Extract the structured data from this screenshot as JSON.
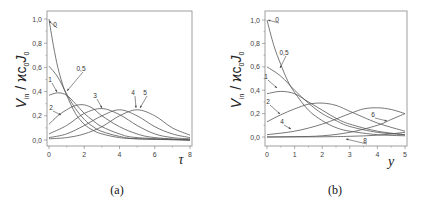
{
  "chart_data": [
    {
      "type": "line",
      "panel": "(a)",
      "title": "",
      "xlabel": "τ",
      "ylabel": "V_in / ϰc0J0",
      "xlim": [
        0,
        8
      ],
      "ylim": [
        0,
        1.0
      ],
      "xticks": [
        "0",
        "2",
        "4",
        "6",
        "8"
      ],
      "yticks": [
        "0,0",
        "0,2",
        "0,4",
        "0,6",
        "0,8",
        "1,0"
      ],
      "grid": false,
      "series": [
        {
          "name": "0",
          "points": [
            [
              0,
              1.0
            ],
            [
              0.25,
              0.78
            ],
            [
              0.5,
              0.6
            ],
            [
              0.75,
              0.47
            ],
            [
              1,
              0.37
            ],
            [
              1.5,
              0.22
            ],
            [
              2,
              0.13
            ],
            [
              2.5,
              0.08
            ],
            [
              3,
              0.05
            ],
            [
              4,
              0.02
            ],
            [
              5,
              0.01
            ],
            [
              8,
              0.0
            ]
          ]
        },
        {
          "name": "0,5",
          "points": [
            [
              0,
              0.61
            ],
            [
              0.5,
              0.52
            ],
            [
              1,
              0.38
            ],
            [
              1.5,
              0.26
            ],
            [
              2,
              0.17
            ],
            [
              2.5,
              0.11
            ],
            [
              3,
              0.07
            ],
            [
              4,
              0.03
            ],
            [
              5,
              0.01
            ],
            [
              8,
              0.0
            ]
          ]
        },
        {
          "name": "1",
          "points": [
            [
              0,
              0.37
            ],
            [
              0.5,
              0.39
            ],
            [
              1,
              0.37
            ],
            [
              1.5,
              0.3
            ],
            [
              2,
              0.22
            ],
            [
              2.5,
              0.16
            ],
            [
              3,
              0.11
            ],
            [
              4,
              0.05
            ],
            [
              5,
              0.02
            ],
            [
              8,
              0.0
            ]
          ]
        },
        {
          "name": "2",
          "points": [
            [
              0,
              0.13
            ],
            [
              0.5,
              0.2
            ],
            [
              1,
              0.25
            ],
            [
              1.5,
              0.285
            ],
            [
              2,
              0.29
            ],
            [
              2.5,
              0.26
            ],
            [
              3,
              0.2
            ],
            [
              4,
              0.11
            ],
            [
              5,
              0.05
            ],
            [
              6,
              0.02
            ],
            [
              8,
              0.0
            ]
          ]
        },
        {
          "name": "3",
          "points": [
            [
              0,
              0.05
            ],
            [
              1,
              0.12
            ],
            [
              2,
              0.22
            ],
            [
              3,
              0.26
            ],
            [
              4,
              0.21
            ],
            [
              5,
              0.12
            ],
            [
              6,
              0.05
            ],
            [
              7,
              0.02
            ],
            [
              8,
              0.01
            ]
          ]
        },
        {
          "name": "4",
          "points": [
            [
              0,
              0.02
            ],
            [
              1,
              0.05
            ],
            [
              2,
              0.12
            ],
            [
              3,
              0.2
            ],
            [
              4,
              0.25
            ],
            [
              5,
              0.2
            ],
            [
              6,
              0.11
            ],
            [
              7,
              0.05
            ],
            [
              8,
              0.02
            ]
          ]
        },
        {
          "name": "5",
          "points": [
            [
              0,
              0.01
            ],
            [
              1,
              0.02
            ],
            [
              2,
              0.05
            ],
            [
              3,
              0.11
            ],
            [
              4,
              0.2
            ],
            [
              5,
              0.25
            ],
            [
              6,
              0.2
            ],
            [
              7,
              0.1
            ],
            [
              8,
              0.04
            ]
          ]
        }
      ],
      "annotations": [
        {
          "text": "0",
          "x": 55,
          "y": 27,
          "ax": 49,
          "ay": 21
        },
        {
          "text": "0,5",
          "x": 81,
          "y": 71,
          "ax": 67,
          "ay": 91
        },
        {
          "text": "1",
          "x": 50,
          "y": 82,
          "ax": 57,
          "ay": 92
        },
        {
          "text": "2",
          "x": 51,
          "y": 110,
          "ax": 61,
          "ay": 115
        },
        {
          "text": "3",
          "x": 95,
          "y": 98,
          "ax": 102,
          "ay": 108
        },
        {
          "text": "4",
          "x": 133,
          "y": 95,
          "ax": 136,
          "ay": 108
        },
        {
          "text": "5",
          "x": 145,
          "y": 95,
          "ax": 140,
          "ay": 108
        }
      ],
      "caption": "(a)"
    },
    {
      "type": "line",
      "panel": "(b)",
      "title": "",
      "xlabel": "y",
      "ylabel": "V_in / ϰc0J0",
      "xlim": [
        0,
        5
      ],
      "ylim": [
        0,
        1.0
      ],
      "xticks": [
        "0",
        "1",
        "2",
        "3",
        "4",
        "5"
      ],
      "yticks": [
        "0,0",
        "0,2",
        "0,4",
        "0,6",
        "0,8",
        "1,0"
      ],
      "grid": false,
      "series": [
        {
          "name": "0",
          "points": [
            [
              0,
              1.0
            ],
            [
              0.25,
              0.78
            ],
            [
              0.5,
              0.62
            ],
            [
              0.75,
              0.48
            ],
            [
              1,
              0.38
            ],
            [
              1.5,
              0.23
            ],
            [
              2,
              0.14
            ],
            [
              2.5,
              0.08
            ],
            [
              3,
              0.05
            ],
            [
              4,
              0.02
            ],
            [
              5,
              0.01
            ]
          ]
        },
        {
          "name": "0,5",
          "points": [
            [
              0,
              0.6
            ],
            [
              0.5,
              0.52
            ],
            [
              1,
              0.4
            ],
            [
              1.5,
              0.29
            ],
            [
              2,
              0.2
            ],
            [
              2.5,
              0.14
            ],
            [
              3,
              0.09
            ],
            [
              4,
              0.04
            ],
            [
              5,
              0.02
            ]
          ]
        },
        {
          "name": "1",
          "points": [
            [
              0,
              0.37
            ],
            [
              0.5,
              0.39
            ],
            [
              1,
              0.37
            ],
            [
              1.5,
              0.3
            ],
            [
              2,
              0.23
            ],
            [
              2.5,
              0.16
            ],
            [
              3,
              0.11
            ],
            [
              4,
              0.05
            ],
            [
              5,
              0.02
            ]
          ]
        },
        {
          "name": "2",
          "points": [
            [
              0,
              0.13
            ],
            [
              0.5,
              0.19
            ],
            [
              1,
              0.24
            ],
            [
              1.5,
              0.28
            ],
            [
              2,
              0.29
            ],
            [
              2.5,
              0.27
            ],
            [
              3,
              0.22
            ],
            [
              4,
              0.12
            ],
            [
              5,
              0.05
            ]
          ]
        },
        {
          "name": "4",
          "points": [
            [
              0,
              0.02
            ],
            [
              1,
              0.05
            ],
            [
              2,
              0.11
            ],
            [
              3,
              0.2
            ],
            [
              3.5,
              0.24
            ],
            [
              4,
              0.25
            ],
            [
              4.5,
              0.235
            ],
            [
              5,
              0.2
            ]
          ]
        },
        {
          "name": "6",
          "points": [
            [
              0,
              0.0
            ],
            [
              1,
              0.003
            ],
            [
              2,
              0.01
            ],
            [
              3,
              0.04
            ],
            [
              4,
              0.1
            ],
            [
              4.5,
              0.15
            ],
            [
              5,
              0.2
            ]
          ]
        },
        {
          "name": "8",
          "points": [
            [
              0,
              0.0
            ],
            [
              2,
              0.002
            ],
            [
              3,
              0.006
            ],
            [
              4,
              0.015
            ],
            [
              5,
              0.04
            ]
          ]
        }
      ],
      "annotations": [
        {
          "text": "0",
          "x": 277,
          "y": 22,
          "ax": 268,
          "ay": 20
        },
        {
          "text": "0,5",
          "x": 284,
          "y": 55,
          "ax": 280,
          "ay": 68
        },
        {
          "text": "1",
          "x": 266,
          "y": 79,
          "ax": 277,
          "ay": 88
        },
        {
          "text": "2",
          "x": 268,
          "y": 104,
          "ax": 280,
          "ay": 114
        },
        {
          "text": "4",
          "x": 282,
          "y": 124,
          "ax": 291,
          "ay": 129
        },
        {
          "text": "6",
          "x": 373,
          "y": 117,
          "ax": 387,
          "ay": 121
        },
        {
          "text": "8",
          "x": 365,
          "y": 143,
          "ax": 346,
          "ay": 139
        }
      ],
      "caption": "(b)"
    }
  ]
}
